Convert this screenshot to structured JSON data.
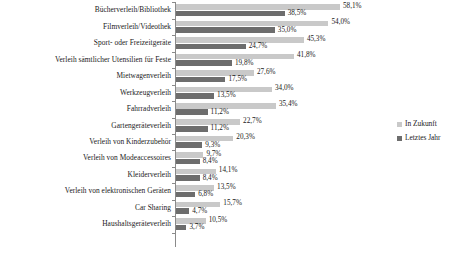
{
  "chart_data": {
    "type": "bar",
    "orientation": "horizontal",
    "title": "",
    "subtitle": "",
    "xlabel": "",
    "ylabel": "",
    "grid": false,
    "value_suffix": "%",
    "decimal_separator": ",",
    "xlim": [
      0,
      58.1
    ],
    "legend_position": "right",
    "categories": [
      "Bücherverleih/Bibliothek",
      "Filmverleih/Videothek",
      "Sport- oder Freizeitgeräte",
      "Verleih sämtlicher Utensilien für Feste",
      "Mietwagenverleih",
      "Werkzeugverleih",
      "Fahrradverleih",
      "Gartengeräteverleih",
      "Verleih von Kinderzubehör",
      "Verleih von Modeaccessoires",
      "Kleiderverleih",
      "Verleih von elektronischen Geräten",
      "Car Sharing",
      "Haushaltsgeräteverleih"
    ],
    "series": [
      {
        "name": "In Zukunft",
        "color": "#c9c9c9",
        "values": [
          58.1,
          54.0,
          45.3,
          41.8,
          27.6,
          34.0,
          35.4,
          22.7,
          20.3,
          9.7,
          14.1,
          13.5,
          15.7,
          10.5
        ],
        "labels": [
          "58,1%",
          "54,0%",
          "45,3%",
          "41,8%",
          "27,6%",
          "34,0%",
          "35,4%",
          "22,7%",
          "20,3%",
          "9,7%",
          "14,1%",
          "13,5%",
          "15,7%",
          "10,5%"
        ]
      },
      {
        "name": "Letztes Jahr",
        "color": "#6d6d6d",
        "values": [
          38.5,
          35.0,
          24.7,
          19.8,
          17.5,
          13.5,
          11.2,
          11.2,
          9.3,
          8.4,
          8.4,
          6.8,
          4.7,
          3.7
        ],
        "labels": [
          "38,5%",
          "35,0%",
          "24,7%",
          "19,8%",
          "17,5%",
          "13,5%",
          "11,2%",
          "11,2%",
          "9,3%",
          "8,4%",
          "8,4%",
          "6,8%",
          "4,7%",
          "3,7%"
        ]
      }
    ]
  },
  "legend": {
    "items": [
      {
        "label": "In Zukunft",
        "color": "#c9c9c9"
      },
      {
        "label": "Letztes Jahr",
        "color": "#6d6d6d"
      }
    ]
  }
}
